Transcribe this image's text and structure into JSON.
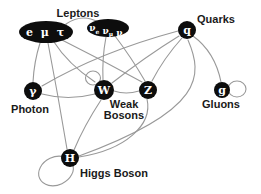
{
  "colors": {
    "background": "#ffffff",
    "node_fill": "#0d0d0d",
    "node_text": "#ffffff",
    "edge": "#999999",
    "label_text": "#1a1a1a"
  },
  "diagram": {
    "nodes": [
      {
        "id": "charged-leptons",
        "shape": "ellipse",
        "label": "e μ τ",
        "cx": 46,
        "cy": 32,
        "rx": 27,
        "ry": 11,
        "font_size": 11,
        "letter_spacing": 2
      },
      {
        "id": "neutrinos",
        "shape": "ellipse",
        "label": "νe νμ ντ",
        "cx": 108,
        "cy": 28,
        "rx": 21,
        "ry": 9,
        "font_size": 9,
        "parts": [
          {
            "base": "ν",
            "sub": "e"
          },
          {
            "base": "ν",
            "sub": "μ"
          },
          {
            "base": "ν",
            "sub": "τ"
          }
        ]
      },
      {
        "id": "quark",
        "shape": "circle",
        "label": "q",
        "cx": 187,
        "cy": 30,
        "r": 9,
        "font_size": 11
      },
      {
        "id": "photon",
        "shape": "circle",
        "label": "γ",
        "cx": 33,
        "cy": 91,
        "r": 9,
        "font_size": 11
      },
      {
        "id": "w-boson",
        "shape": "circle",
        "label": "W",
        "cx": 104,
        "cy": 90,
        "r": 10,
        "font_size": 11
      },
      {
        "id": "z-boson",
        "shape": "circle",
        "label": "Z",
        "cx": 148,
        "cy": 90,
        "r": 9,
        "font_size": 11
      },
      {
        "id": "gluon",
        "shape": "circle",
        "label": "g",
        "cx": 222,
        "cy": 90,
        "r": 8,
        "font_size": 11
      },
      {
        "id": "higgs",
        "shape": "circle",
        "label": "H",
        "cx": 70,
        "cy": 158,
        "r": 9,
        "font_size": 11
      }
    ],
    "labels": [
      {
        "id": "leptons",
        "text": "Leptons",
        "x": 78,
        "y": 17
      },
      {
        "id": "quarks",
        "text": "Quarks",
        "x": 216,
        "y": 23
      },
      {
        "id": "photon",
        "text": "Photon",
        "x": 30,
        "y": 113
      },
      {
        "id": "weak-bosons",
        "text": "Weak Bosons",
        "lines": [
          "Weak",
          "Bosons"
        ],
        "x": 124,
        "y": 108,
        "line_height": 11
      },
      {
        "id": "gluons",
        "text": "Gluons",
        "x": 221,
        "y": 108
      },
      {
        "id": "higgs-boson",
        "text": "Higgs Boson",
        "x": 114,
        "y": 177
      }
    ],
    "edges": [
      {
        "from": "charged-leptons",
        "to": "photon",
        "path": "M 40,43 Q 34,62 33,82"
      },
      {
        "from": "charged-leptons",
        "to": "w-boson",
        "path": "M 54,42 Q 68,64 95,82"
      },
      {
        "from": "charged-leptons",
        "to": "z-boson",
        "path": "M 62,40 Q 102,60 142,82"
      },
      {
        "from": "charged-leptons",
        "to": "higgs",
        "path": "M 48,43 Q 58,95 67,149"
      },
      {
        "from": "charged-leptons",
        "to": "neutrinos",
        "path": "M 66,24 Q 82,13 98,22"
      },
      {
        "from": "neutrinos",
        "to": "w-boson",
        "path": "M 106,37 Q 102,58 103,80"
      },
      {
        "from": "neutrinos",
        "to": "z-boson",
        "path": "M 115,36 Q 131,57 145,81"
      },
      {
        "from": "quark",
        "to": "photon",
        "path": "M 178,31 Q 100,52 42,86"
      },
      {
        "from": "quark",
        "to": "w-boson",
        "path": "M 179,36 Q 145,57 112,83"
      },
      {
        "from": "quark",
        "to": "z-boson",
        "path": "M 182,38 Q 164,58 152,81"
      },
      {
        "from": "quark",
        "to": "gluon",
        "path": "M 193,36 Q 215,52 221,82"
      },
      {
        "from": "quark",
        "to": "higgs",
        "path": "M 188,40 C 203,75 205,110 79,156"
      },
      {
        "from": "photon",
        "to": "w-boson",
        "path": "M 42,94 Q 68,101 95,94"
      },
      {
        "from": "w-boson",
        "to": "z-boson",
        "path": "M 114,91 Q 126,95 139,91"
      },
      {
        "from": "w-boson",
        "to": "higgs",
        "path": "M 101,100 Q 84,126 74,150"
      },
      {
        "from": "z-boson",
        "to": "higgs",
        "path": "M 147,99 C 153,125 125,150 79,157"
      }
    ],
    "loops": [
      {
        "at": "w-boson",
        "cx": 93,
        "cy": 78,
        "rx": 7.5,
        "ry": 7,
        "rotate": 0
      },
      {
        "at": "gluon",
        "cx": 237,
        "cy": 89,
        "rx": 9,
        "ry": 8,
        "rotate": 0
      },
      {
        "at": "higgs",
        "cx": 56,
        "cy": 171,
        "rx": 18,
        "ry": 14,
        "rotate": -25
      }
    ]
  }
}
